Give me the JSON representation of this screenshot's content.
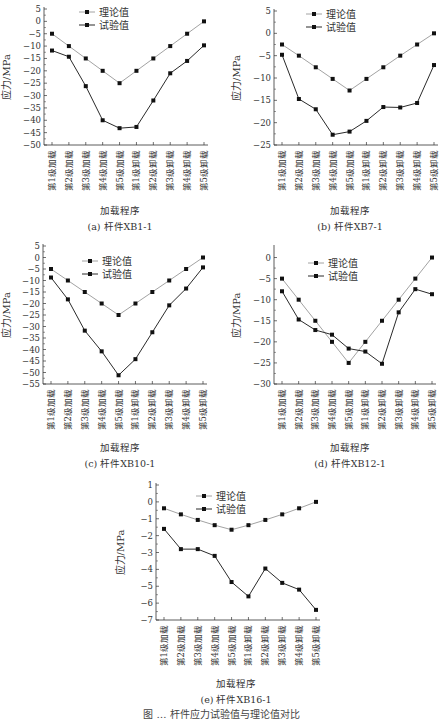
{
  "figure": {
    "caption": "图 … 杆件应力试验值与理论值对比",
    "x_categories": [
      "第1级加载",
      "第2级加载",
      "第3级加载",
      "第4级加载",
      "第5级加载",
      "第1级卸载",
      "第2级卸载",
      "第3级卸载",
      "第4级卸载",
      "第5级卸载"
    ],
    "xlabel": "加载程序",
    "ylabel": "应力/MPa",
    "legend": [
      "理论值",
      "试验值"
    ],
    "colors": {
      "theory": "#8a8a8a",
      "test": "#2a2a2a",
      "axis": "#333333"
    }
  },
  "chart_data": [
    {
      "id": "a",
      "type": "line",
      "title": "(a) 杆件XB1-1",
      "categories": [
        "第1级加载",
        "第2级加载",
        "第3级加载",
        "第4级加载",
        "第5级加载",
        "第1级卸载",
        "第2级卸载",
        "第3级卸载",
        "第4级卸载",
        "第5级卸载"
      ],
      "xlabel": "加载程序",
      "ylabel": "应力/MPa",
      "ylim": [
        -50,
        5
      ],
      "yticks": [
        5,
        0,
        -5,
        -10,
        -15,
        -20,
        -25,
        -30,
        -35,
        -40,
        -45,
        -50
      ],
      "legend_position": "top-center",
      "series": [
        {
          "name": "理论值",
          "values": [
            -5,
            -10,
            -15,
            -20,
            -25,
            -20,
            -15,
            -10,
            -5,
            0
          ]
        },
        {
          "name": "试验值",
          "values": [
            -11.8,
            -14.3,
            -26.2,
            -40.0,
            -43.2,
            -42.7,
            -32.0,
            -21.0,
            -16.0,
            -9.7
          ]
        }
      ]
    },
    {
      "id": "b",
      "type": "line",
      "title": "(b) 杆件XB7-1",
      "categories": [
        "第1级加载",
        "第2级加载",
        "第3级加载",
        "第4级加载",
        "第5级加载",
        "第1级卸载",
        "第2级卸载",
        "第3级卸载",
        "第4级卸载",
        "第5级卸载"
      ],
      "xlabel": "加载程序",
      "ylabel": "应力/MPa",
      "ylim": [
        -25,
        5
      ],
      "yticks": [
        5,
        0,
        -5,
        -10,
        -15,
        -20,
        -25
      ],
      "legend_position": "top-center",
      "series": [
        {
          "name": "理论值",
          "values": [
            -2.5,
            -5,
            -7.6,
            -10.2,
            -12.8,
            -10.2,
            -7.6,
            -5,
            -2.5,
            0
          ]
        },
        {
          "name": "试验值",
          "values": [
            -4.8,
            -14.7,
            -17.0,
            -22.7,
            -22.0,
            -19.6,
            -16.5,
            -16.6,
            -15.6,
            -7.1
          ]
        }
      ]
    },
    {
      "id": "c",
      "type": "line",
      "title": "(c) 杆件XB10-1",
      "categories": [
        "第1级加载",
        "第2级加载",
        "第3级加载",
        "第4级加载",
        "第5级加载",
        "第1级卸载",
        "第2级卸载",
        "第3级卸载",
        "第4级卸载",
        "第5级卸载"
      ],
      "xlabel": "加载程序",
      "ylabel": "应力/MPa",
      "ylim": [
        -55,
        5
      ],
      "yticks": [
        5,
        0,
        -5,
        -10,
        -15,
        -20,
        -25,
        -30,
        -35,
        -40,
        -45,
        -50,
        -55
      ],
      "legend_position": "top-center",
      "series": [
        {
          "name": "理论值",
          "values": [
            -5,
            -10,
            -15,
            -20,
            -25,
            -20,
            -15,
            -10,
            -5,
            0
          ]
        },
        {
          "name": "试验值",
          "values": [
            -8.7,
            -18.2,
            -31.8,
            -40.8,
            -51.2,
            -44.2,
            -32.5,
            -20.8,
            -13.5,
            -4.3
          ]
        }
      ]
    },
    {
      "id": "d",
      "type": "line",
      "title": "(d) 杆件XB12-1",
      "categories": [
        "第1级加载",
        "第2级加载",
        "第3级加载",
        "第4级加载",
        "第5级加载",
        "第1级卸载",
        "第2级卸载",
        "第3级卸载",
        "第4级卸载",
        "第5级卸载"
      ],
      "xlabel": "加载程序",
      "ylabel": "应力/MPa",
      "ylim": [
        -30,
        2.5
      ],
      "yticks": [
        0,
        -5,
        -10,
        -15,
        -20,
        -25,
        -30
      ],
      "legend_position": "top-center",
      "series": [
        {
          "name": "理论值",
          "values": [
            -5,
            -10,
            -15,
            -20,
            -25,
            -20,
            -15,
            -10,
            -5,
            0
          ]
        },
        {
          "name": "试验值",
          "values": [
            -8.0,
            -14.7,
            -17.2,
            -18.3,
            -21.6,
            -22.3,
            -25.2,
            -13.0,
            -7.5,
            -8.7
          ]
        }
      ]
    },
    {
      "id": "e",
      "type": "line",
      "title": "(e) 杆件XB16-1",
      "categories": [
        "第1级加载",
        "第2级加载",
        "第3级加载",
        "第4级加载",
        "第5级加载",
        "第1级卸载",
        "第2级卸载",
        "第3级卸载",
        "第4级卸载",
        "第5级卸载"
      ],
      "xlabel": "加载程序",
      "ylabel": "应力/MPa",
      "ylim": [
        -7,
        1
      ],
      "yticks": [
        1,
        0,
        -1,
        -2,
        -3,
        -4,
        -5,
        -6,
        -7
      ],
      "legend_position": "top-center",
      "series": [
        {
          "name": "理论值",
          "values": [
            -0.38,
            -0.74,
            -1.07,
            -1.38,
            -1.65,
            -1.38,
            -1.07,
            -0.74,
            -0.38,
            0
          ]
        },
        {
          "name": "试验值",
          "values": [
            -1.6,
            -2.8,
            -2.8,
            -3.2,
            -4.75,
            -5.6,
            -3.95,
            -4.8,
            -5.2,
            -6.4
          ]
        }
      ]
    }
  ]
}
